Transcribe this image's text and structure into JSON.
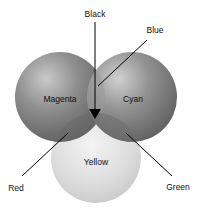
{
  "diagram": {
    "type": "subtractive-color-venn",
    "circles": [
      {
        "name": "Magenta",
        "label": "Magenta",
        "cx": 60,
        "cy": 97,
        "r": 45,
        "shade": "#7a7a7a"
      },
      {
        "name": "Cyan",
        "label": "Cyan",
        "cx": 132,
        "cy": 97,
        "r": 45,
        "shade": "#7e7e7e"
      },
      {
        "name": "Yellow",
        "label": "Yellow",
        "cx": 96,
        "cy": 158,
        "r": 45,
        "shade": "#d8d8d8"
      }
    ],
    "callouts": [
      {
        "label": "Black",
        "x1": 95,
        "y1": 22,
        "x2": 95,
        "y2": 112,
        "arrow": true,
        "tx": 95,
        "ty": 17
      },
      {
        "label": "Blue",
        "x1": 147,
        "y1": 40,
        "x2": 98,
        "y2": 86,
        "arrow": false,
        "tx": 155,
        "ty": 33
      },
      {
        "label": "Red",
        "x1": 22,
        "y1": 176,
        "x2": 68,
        "y2": 133,
        "arrow": false,
        "tx": 16,
        "ty": 191
      },
      {
        "label": "Green",
        "x1": 172,
        "y1": 176,
        "x2": 126,
        "y2": 133,
        "arrow": false,
        "tx": 178,
        "ty": 190
      }
    ]
  }
}
